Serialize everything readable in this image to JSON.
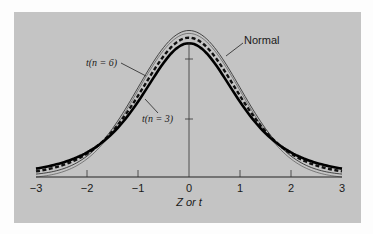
{
  "chart_data": {
    "type": "line",
    "title": "",
    "xlabel": "Z or t",
    "ylabel": "",
    "xlim": [
      -3,
      3
    ],
    "x_ticks": [
      -3,
      -2,
      -1,
      0,
      1,
      2,
      3
    ],
    "x_tick_labels": [
      "−3",
      "−2",
      "−1",
      "0",
      "1",
      "2",
      "3"
    ],
    "grid": false,
    "legend": "none (curves labeled by annotations with arrows)",
    "series": [
      {
        "name": "Normal",
        "style": "thin double line (outer)",
        "x": [
          -3,
          -2.5,
          -2,
          -1.5,
          -1,
          -0.5,
          0,
          0.5,
          1,
          1.5,
          2,
          2.5,
          3
        ],
        "values": [
          0.004,
          0.018,
          0.054,
          0.13,
          0.242,
          0.352,
          0.399,
          0.352,
          0.242,
          0.13,
          0.054,
          0.018,
          0.004
        ]
      },
      {
        "name": "t(n = 6)",
        "style": "dashed",
        "x": [
          -3,
          -2.5,
          -2,
          -1.5,
          -1,
          -0.5,
          0,
          0.5,
          1,
          1.5,
          2,
          2.5,
          3
        ],
        "values": [
          0.022,
          0.036,
          0.064,
          0.127,
          0.223,
          0.335,
          0.383,
          0.335,
          0.223,
          0.127,
          0.064,
          0.036,
          0.022
        ]
      },
      {
        "name": "t(n = 3)",
        "style": "thick solid",
        "x": [
          -3,
          -2.5,
          -2,
          -1.5,
          -1,
          -0.5,
          0,
          0.5,
          1,
          1.5,
          2,
          2.5,
          3
        ],
        "values": [
          0.023,
          0.039,
          0.068,
          0.127,
          0.207,
          0.317,
          0.368,
          0.317,
          0.207,
          0.127,
          0.068,
          0.039,
          0.023
        ]
      }
    ],
    "annotations": [
      {
        "text": "Normal",
        "points_to": "Normal curve, right shoulder"
      },
      {
        "text": "t(n = 6)",
        "points_to": "dashed curve, left shoulder"
      },
      {
        "text": "t(n = 3)",
        "points_to": "thick curve, left shoulder"
      }
    ]
  },
  "labels": {
    "normal": "Normal",
    "t6": "t(n = 6)",
    "t3": "t(n = 3)",
    "xlabel": "Z or t",
    "ticks": [
      "−3",
      "−2",
      "−1",
      "0",
      "1",
      "2",
      "3"
    ]
  }
}
